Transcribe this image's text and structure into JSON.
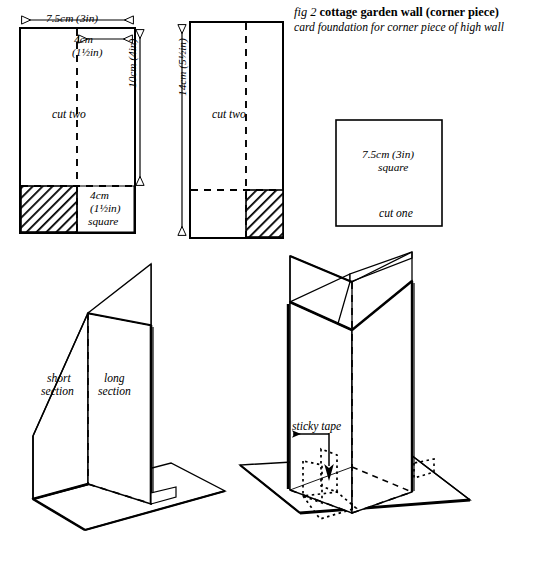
{
  "figure": {
    "number": "fig 2",
    "title": "cottage garden wall (corner piece)",
    "subtitle": "card foundation for corner piece of high wall"
  },
  "pieces": {
    "piece1": {
      "name": "long-section-card",
      "width_label": "7.5cm (3in)",
      "inner_width_label_line1": "4cm",
      "inner_width_label_line2": "(1½in)",
      "height_label": "10cm (4in)",
      "quantity_label": "cut two",
      "tab_label_line1": "4cm",
      "tab_label_line2": "(1½in)",
      "tab_label_line3": "square",
      "tab_position": "left"
    },
    "piece2": {
      "name": "short-section-card",
      "height_label": "14cm (5½in)",
      "quantity_label": "cut two",
      "tab_position": "right"
    },
    "piece3": {
      "name": "base-square-card",
      "size_label_line1": "7.5cm (3in)",
      "size_label_line2": "square",
      "quantity_label": "cut one"
    }
  },
  "assembly_left": {
    "name": "corner-assembly",
    "label_short_line1": "short",
    "label_short_line2": "section",
    "label_long_line1": "long",
    "label_long_line2": "section"
  },
  "assembly_right": {
    "name": "crossed-assembly",
    "tape_label": "sticky tape"
  },
  "colors": {
    "ink": "#000000",
    "paper": "#ffffff",
    "hatch": "#1a1a1a"
  }
}
